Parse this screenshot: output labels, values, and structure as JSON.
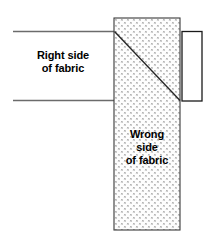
{
  "diagram": {
    "type": "sewing-fabric-fold-illustration",
    "canvas": {
      "width": 211,
      "height": 245,
      "background": "#ffffff"
    },
    "colors": {
      "outline": "#1a1a1a",
      "band_line": "#6b6b6b",
      "hatch_fill": "#fdfdfd",
      "hatch_dot": "#8f8f8f",
      "text": "#000000"
    },
    "labels": {
      "right_side": {
        "name": "right-side-of-fabric",
        "lines": [
          "Right side",
          "of fabric"
        ],
        "line1": "Right side",
        "line2": "of fabric"
      },
      "wrong_side": {
        "name": "wrong-side-of-fabric",
        "lines": [
          "Wrong",
          "side",
          "of fabric"
        ],
        "line1": "Wrong",
        "line2": "side",
        "line3": "of fabric"
      }
    },
    "shapes": {
      "fabric_band": {
        "name": "fabric-band-right-side",
        "description": "Horizontal fabric band shown right side up",
        "top_line": {
          "x1": 13,
          "y1": 31.5,
          "x2": 115,
          "y2": 31.5
        },
        "bottom_line": {
          "x1": 13,
          "y1": 100.5,
          "x2": 115,
          "y2": 100.5
        }
      },
      "folded_column": {
        "name": "folded-fabric-column-wrong-side",
        "description": "Vertical hatched column showing wrong side of fabric",
        "x": 114,
        "y": 18,
        "width": 66,
        "height": 212
      },
      "fold_diagonal": {
        "name": "fold-diagonal-line",
        "description": "Diagonal fold crease from upper-left to lower-right of column",
        "x1": 114.5,
        "y1": 31.5,
        "x2": 180,
        "y2": 100.5
      },
      "tail_rectangle": {
        "name": "fabric-tail-rectangle",
        "description": "Small open rectangle extending to the right of the column",
        "x": 182,
        "y": 31.5,
        "width": 20,
        "height": 69.5
      }
    }
  }
}
